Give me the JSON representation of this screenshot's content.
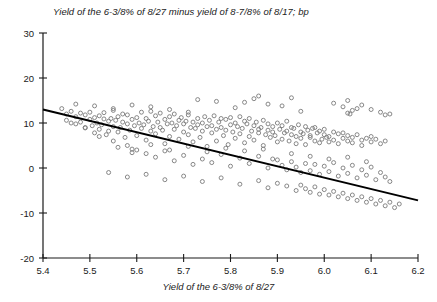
{
  "chart_data": {
    "type": "scatter",
    "title": "Yield of the 6-3/8% of 8/27 minus yield of 8-7/8% of 8/17; bp",
    "xlabel": "Yield of the 6-3/8% of 8/27",
    "ylabel": "",
    "xlim": [
      5.4,
      6.2
    ],
    "ylim": [
      -20,
      30
    ],
    "xticks": [
      5.4,
      5.5,
      5.6,
      5.7,
      5.8,
      5.9,
      6.0,
      6.1,
      6.2
    ],
    "xticklabels": [
      "5.4",
      "5.5",
      "5.6",
      "5.7",
      "5.8",
      "5.9",
      "6.0",
      "6.1",
      "6.2"
    ],
    "yticks": [
      -20,
      -10,
      0,
      10,
      20,
      30
    ],
    "yticklabels": [
      "-20",
      "-10",
      "0",
      "10",
      "20",
      "30"
    ],
    "grid": false,
    "legend": null,
    "marker": {
      "shape": "open-circle",
      "color": "#7a7a7a",
      "size": 4
    },
    "trendline": {
      "type": "linear",
      "color": "#000000",
      "x": [
        5.4,
        6.2
      ],
      "y": [
        13.0,
        -7.2
      ]
    },
    "points": [
      [
        5.44,
        13.2
      ],
      [
        5.45,
        12.0
      ],
      [
        5.45,
        10.6
      ],
      [
        5.46,
        12.6
      ],
      [
        5.47,
        11.4
      ],
      [
        5.47,
        9.8
      ],
      [
        5.48,
        12.2
      ],
      [
        5.48,
        10.2
      ],
      [
        5.49,
        11.8
      ],
      [
        5.49,
        8.9
      ],
      [
        5.5,
        12.4
      ],
      [
        5.5,
        10.8
      ],
      [
        5.505,
        9.4
      ],
      [
        5.51,
        11.2
      ],
      [
        5.51,
        7.8
      ],
      [
        5.515,
        10.0
      ],
      [
        5.52,
        11.6
      ],
      [
        5.52,
        8.6
      ],
      [
        5.525,
        9.6
      ],
      [
        5.53,
        10.9
      ],
      [
        5.53,
        12.3
      ],
      [
        5.535,
        7.4
      ],
      [
        5.54,
        10.4
      ],
      [
        5.54,
        8.2
      ],
      [
        5.545,
        11.0
      ],
      [
        5.55,
        9.2
      ],
      [
        5.55,
        12.8
      ],
      [
        5.555,
        10.6
      ],
      [
        5.56,
        8.0
      ],
      [
        5.56,
        11.4
      ],
      [
        5.565,
        9.0
      ],
      [
        5.57,
        10.2
      ],
      [
        5.57,
        12.0
      ],
      [
        5.575,
        6.8
      ],
      [
        5.58,
        9.8
      ],
      [
        5.58,
        11.8
      ],
      [
        5.585,
        8.4
      ],
      [
        5.59,
        10.8
      ],
      [
        5.59,
        4.2
      ],
      [
        5.595,
        9.4
      ],
      [
        5.6,
        11.2
      ],
      [
        5.6,
        7.2
      ],
      [
        5.605,
        10.0
      ],
      [
        5.61,
        12.4
      ],
      [
        5.61,
        8.8
      ],
      [
        5.615,
        9.6
      ],
      [
        5.62,
        11.0
      ],
      [
        5.62,
        6.2
      ],
      [
        5.625,
        10.4
      ],
      [
        5.63,
        8.2
      ],
      [
        5.63,
        12.6
      ],
      [
        5.635,
        9.2
      ],
      [
        5.64,
        11.6
      ],
      [
        5.64,
        7.6
      ],
      [
        5.645,
        10.2
      ],
      [
        5.65,
        9.0
      ],
      [
        5.65,
        12.2
      ],
      [
        5.655,
        8.4
      ],
      [
        5.66,
        10.8
      ],
      [
        5.66,
        5.4
      ],
      [
        5.665,
        9.8
      ],
      [
        5.67,
        11.4
      ],
      [
        5.67,
        7.0
      ],
      [
        5.675,
        10.0
      ],
      [
        5.68,
        8.6
      ],
      [
        5.68,
        12.0
      ],
      [
        5.685,
        9.4
      ],
      [
        5.69,
        10.6
      ],
      [
        5.69,
        6.4
      ],
      [
        5.695,
        11.2
      ],
      [
        5.7,
        8.0
      ],
      [
        5.7,
        9.8
      ],
      [
        5.705,
        10.4
      ],
      [
        5.71,
        7.4
      ],
      [
        5.71,
        11.8
      ],
      [
        5.715,
        9.0
      ],
      [
        5.72,
        10.2
      ],
      [
        5.72,
        5.8
      ],
      [
        5.725,
        8.8
      ],
      [
        5.73,
        11.0
      ],
      [
        5.73,
        9.6
      ],
      [
        5.735,
        6.8
      ],
      [
        5.74,
        10.0
      ],
      [
        5.74,
        8.2
      ],
      [
        5.745,
        11.4
      ],
      [
        5.75,
        9.2
      ],
      [
        5.75,
        4.8
      ],
      [
        5.755,
        10.6
      ],
      [
        5.76,
        7.8
      ],
      [
        5.76,
        9.4
      ],
      [
        5.765,
        11.6
      ],
      [
        5.77,
        8.6
      ],
      [
        5.77,
        6.0
      ],
      [
        5.775,
        10.2
      ],
      [
        5.78,
        9.0
      ],
      [
        5.78,
        11.0
      ],
      [
        5.785,
        7.2
      ],
      [
        5.79,
        8.4
      ],
      [
        5.79,
        10.8
      ],
      [
        5.795,
        5.2
      ],
      [
        5.8,
        9.6
      ],
      [
        5.8,
        11.2
      ],
      [
        5.805,
        8.0
      ],
      [
        5.81,
        10.0
      ],
      [
        5.81,
        6.6
      ],
      [
        5.815,
        9.2
      ],
      [
        5.82,
        11.4
      ],
      [
        5.82,
        7.6
      ],
      [
        5.825,
        8.8
      ],
      [
        5.83,
        10.4
      ],
      [
        5.83,
        5.6
      ],
      [
        5.835,
        9.8
      ],
      [
        5.84,
        7.0
      ],
      [
        5.84,
        11.0
      ],
      [
        5.845,
        8.2
      ],
      [
        5.85,
        9.4
      ],
      [
        5.85,
        6.2
      ],
      [
        5.855,
        10.2
      ],
      [
        5.86,
        7.8
      ],
      [
        5.86,
        8.6
      ],
      [
        5.865,
        9.0
      ],
      [
        5.87,
        5.0
      ],
      [
        5.87,
        10.6
      ],
      [
        5.875,
        7.4
      ],
      [
        5.88,
        8.4
      ],
      [
        5.88,
        9.8
      ],
      [
        5.885,
        6.8
      ],
      [
        5.89,
        8.0
      ],
      [
        5.89,
        9.2
      ],
      [
        5.895,
        7.2
      ],
      [
        5.9,
        10.0
      ],
      [
        5.9,
        5.8
      ],
      [
        5.905,
        8.6
      ],
      [
        5.91,
        6.4
      ],
      [
        5.91,
        9.4
      ],
      [
        5.915,
        7.8
      ],
      [
        5.92,
        8.2
      ],
      [
        5.92,
        10.4
      ],
      [
        5.925,
        6.0
      ],
      [
        5.93,
        7.4
      ],
      [
        5.93,
        9.0
      ],
      [
        5.935,
        8.8
      ],
      [
        5.94,
        5.4
      ],
      [
        5.94,
        7.0
      ],
      [
        5.945,
        9.6
      ],
      [
        5.95,
        8.0
      ],
      [
        5.95,
        6.6
      ],
      [
        5.955,
        7.6
      ],
      [
        5.96,
        9.2
      ],
      [
        5.96,
        5.2
      ],
      [
        5.965,
        8.4
      ],
      [
        5.97,
        6.8
      ],
      [
        5.97,
        7.2
      ],
      [
        5.975,
        8.8
      ],
      [
        5.98,
        6.0
      ],
      [
        5.98,
        9.0
      ],
      [
        5.985,
        7.8
      ],
      [
        5.99,
        5.6
      ],
      [
        5.99,
        8.2
      ],
      [
        5.995,
        6.4
      ],
      [
        6.0,
        7.4
      ],
      [
        6.0,
        8.6
      ],
      [
        6.005,
        6.8
      ],
      [
        6.01,
        5.8
      ],
      [
        6.01,
        7.0
      ],
      [
        6.02,
        8.0
      ],
      [
        6.02,
        6.2
      ],
      [
        6.03,
        7.6
      ],
      [
        6.03,
        5.4
      ],
      [
        6.04,
        6.6
      ],
      [
        6.04,
        7.8
      ],
      [
        6.05,
        6.0
      ],
      [
        6.05,
        7.2
      ],
      [
        6.06,
        5.6
      ],
      [
        6.06,
        6.8
      ],
      [
        6.07,
        7.4
      ],
      [
        6.08,
        6.2
      ],
      [
        6.08,
        5.0
      ],
      [
        6.09,
        6.6
      ],
      [
        6.1,
        7.0
      ],
      [
        6.1,
        5.8
      ],
      [
        6.11,
        6.4
      ],
      [
        6.12,
        5.4
      ],
      [
        6.13,
        6.0
      ],
      [
        5.46,
        10.0
      ],
      [
        5.49,
        9.0
      ],
      [
        5.52,
        7.0
      ],
      [
        5.55,
        6.0
      ],
      [
        5.58,
        5.0
      ],
      [
        5.6,
        4.0
      ],
      [
        5.62,
        3.2
      ],
      [
        5.64,
        2.4
      ],
      [
        5.66,
        3.8
      ],
      [
        5.68,
        1.6
      ],
      [
        5.7,
        2.8
      ],
      [
        5.72,
        0.8
      ],
      [
        5.74,
        2.0
      ],
      [
        5.76,
        1.2
      ],
      [
        5.78,
        3.0
      ],
      [
        5.8,
        0.4
      ],
      [
        5.82,
        2.2
      ],
      [
        5.84,
        1.0
      ],
      [
        5.86,
        2.6
      ],
      [
        5.88,
        0.0
      ],
      [
        5.9,
        1.8
      ],
      [
        5.91,
        0.6
      ],
      [
        5.92,
        -0.4
      ],
      [
        5.93,
        1.4
      ],
      [
        5.94,
        0.2
      ],
      [
        5.95,
        -1.0
      ],
      [
        5.96,
        1.0
      ],
      [
        5.97,
        -0.6
      ],
      [
        5.98,
        0.8
      ],
      [
        5.99,
        -1.4
      ],
      [
        6.0,
        0.4
      ],
      [
        6.01,
        -0.8
      ],
      [
        6.02,
        1.2
      ],
      [
        6.03,
        -1.8
      ],
      [
        6.04,
        0.0
      ],
      [
        6.05,
        -1.2
      ],
      [
        6.06,
        0.6
      ],
      [
        6.07,
        -2.2
      ],
      [
        6.08,
        -0.4
      ],
      [
        6.09,
        -1.6
      ],
      [
        6.1,
        0.2
      ],
      [
        6.11,
        -2.6
      ],
      [
        6.12,
        -1.0
      ],
      [
        6.13,
        -2.0
      ],
      [
        6.14,
        -3.0
      ],
      [
        5.56,
        4.6
      ],
      [
        5.59,
        3.4
      ],
      [
        5.63,
        5.2
      ],
      [
        5.67,
        4.0
      ],
      [
        5.71,
        4.8
      ],
      [
        5.75,
        3.6
      ],
      [
        5.79,
        4.4
      ],
      [
        5.83,
        3.8
      ],
      [
        5.87,
        4.2
      ],
      [
        5.89,
        2.0
      ],
      [
        5.93,
        3.2
      ],
      [
        5.97,
        2.6
      ],
      [
        6.01,
        2.0
      ],
      [
        6.05,
        2.4
      ],
      [
        6.09,
        1.4
      ],
      [
        5.54,
        -1.0
      ],
      [
        5.58,
        -2.0
      ],
      [
        5.62,
        -1.4
      ],
      [
        5.66,
        -2.6
      ],
      [
        5.7,
        -1.8
      ],
      [
        5.74,
        -3.0
      ],
      [
        5.78,
        -2.2
      ],
      [
        5.82,
        -3.6
      ],
      [
        5.86,
        -2.8
      ],
      [
        5.88,
        -4.4
      ],
      [
        5.9,
        -3.4
      ],
      [
        5.92,
        -4.0
      ],
      [
        5.94,
        -5.0
      ],
      [
        5.95,
        -3.8
      ],
      [
        5.96,
        -4.6
      ],
      [
        5.97,
        -5.4
      ],
      [
        5.98,
        -4.2
      ],
      [
        5.99,
        -5.8
      ],
      [
        6.0,
        -4.8
      ],
      [
        6.01,
        -6.0
      ],
      [
        6.02,
        -5.2
      ],
      [
        6.03,
        -6.4
      ],
      [
        6.04,
        -5.6
      ],
      [
        6.05,
        -6.8
      ],
      [
        6.06,
        -6.0
      ],
      [
        6.07,
        -7.2
      ],
      [
        6.08,
        -6.4
      ],
      [
        6.09,
        -7.6
      ],
      [
        6.1,
        -6.8
      ],
      [
        6.11,
        -8.0
      ],
      [
        6.12,
        -7.2
      ],
      [
        6.13,
        -8.4
      ],
      [
        6.14,
        -7.6
      ],
      [
        6.15,
        -8.8
      ],
      [
        6.16,
        -8.0
      ],
      [
        6.02,
        14.4
      ],
      [
        6.04,
        13.6
      ],
      [
        6.05,
        15.0
      ],
      [
        6.06,
        12.8
      ],
      [
        6.07,
        13.2
      ],
      [
        6.05,
        12.2
      ],
      [
        6.055,
        12.0
      ],
      [
        6.08,
        14.0
      ],
      [
        5.83,
        14.6
      ],
      [
        5.85,
        15.4
      ],
      [
        5.88,
        14.2
      ],
      [
        5.91,
        13.8
      ],
      [
        5.95,
        12.6
      ],
      [
        5.73,
        15.2
      ],
      [
        5.77,
        14.8
      ],
      [
        5.81,
        13.4
      ],
      [
        5.67,
        13.0
      ],
      [
        5.71,
        12.4
      ],
      [
        5.63,
        13.6
      ],
      [
        5.59,
        14.0
      ],
      [
        5.55,
        13.2
      ],
      [
        5.51,
        13.8
      ],
      [
        5.47,
        14.2
      ],
      [
        5.86,
        16.0
      ],
      [
        5.93,
        15.6
      ],
      [
        6.1,
        13.0
      ],
      [
        6.12,
        12.4
      ],
      [
        6.13,
        11.8
      ],
      [
        6.14,
        12.0
      ]
    ]
  }
}
